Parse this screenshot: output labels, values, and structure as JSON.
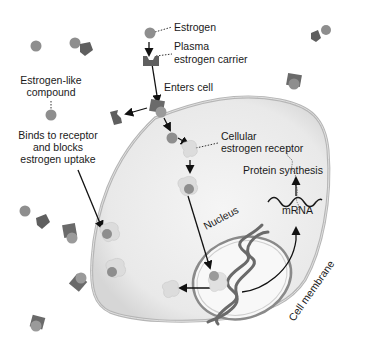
{
  "diagram": {
    "type": "biological-process",
    "labels": {
      "estrogen": "Estrogen",
      "plasma_carrier_1": "Plasma",
      "plasma_carrier_2": "estrogen carrier",
      "enters_cell": "Enters cell",
      "estrogen_like_1": "Estrogen-like",
      "estrogen_like_2": "compound",
      "binds_1": "Binds to receptor",
      "binds_2": "and blocks",
      "binds_3": "estrogen uptake",
      "cellular_receptor_1": "Cellular",
      "cellular_receptor_2": "estrogen receptor",
      "protein_synthesis": "Protein synthesis",
      "mrna": "mRNA",
      "nucleus": "Nucleus",
      "cell_membrane": "Cell membrane"
    },
    "colors": {
      "molecule": "#8e8e8e",
      "carrier": "#5f5f5f",
      "receptor": "#dcdcdc",
      "cell_fill": "#ececec",
      "membrane": "#bdbdbd",
      "nucleus_fill": "#f7f7f7",
      "dna": "#6a6a6a",
      "arrow": "#111111"
    }
  }
}
